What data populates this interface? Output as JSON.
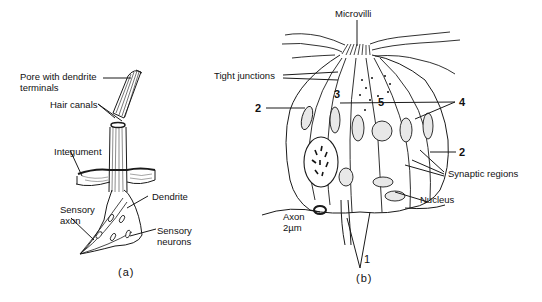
{
  "panel_a": {
    "caption": "(a)",
    "labels": {
      "pore": "Pore with dendrite",
      "pore_line2": "terminals",
      "hair_canals": "Hair canals",
      "integument": "Integument",
      "dendrite": "Dendrite",
      "sensory_axon": "Sensory",
      "sensory_axon_line2": "axon",
      "sensory_neurons": "Sensory",
      "sensory_neurons_line2": "neurons"
    }
  },
  "panel_b": {
    "caption": "(b)",
    "labels": {
      "microvilli": "Microvilli",
      "tight_junctions": "Tight junctions",
      "synaptic_regions": "Synaptic regions",
      "nucleus": "Nucleus",
      "axon": "Axon",
      "scale": "2µm"
    },
    "numbers": {
      "n1": "1",
      "n2_left": "2",
      "n2_right": "2",
      "n3": "3",
      "n4": "4",
      "n5": "5"
    }
  }
}
